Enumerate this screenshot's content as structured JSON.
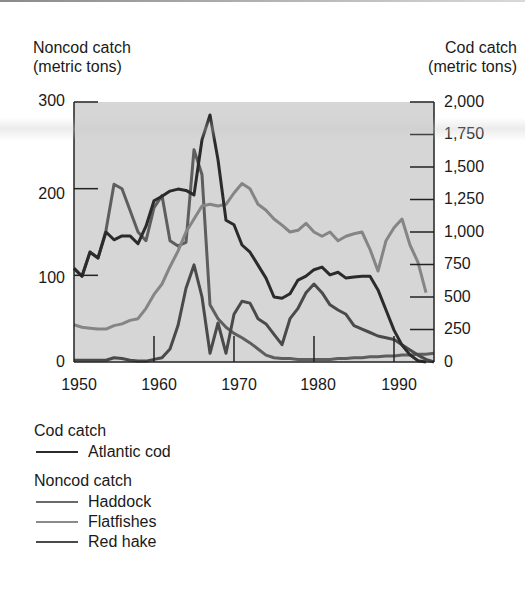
{
  "chart_data": {
    "type": "line",
    "title": "",
    "left_axis": {
      "title_line1": "Noncod catch",
      "title_line2": "(metric tons)",
      "ticks": [
        0,
        100,
        200,
        300
      ],
      "tick_labels": [
        "0",
        "100",
        "200",
        "300"
      ],
      "ylim": [
        0,
        300
      ]
    },
    "right_axis": {
      "title_line1": "Cod catch",
      "title_line2": "(metric tons)",
      "ticks": [
        0,
        250,
        500,
        750,
        1000,
        1250,
        1500,
        1750,
        2000
      ],
      "tick_labels": [
        "0",
        "250",
        "500",
        "750",
        "1,000",
        "1,250",
        "1,500",
        "1,750",
        "2,000"
      ],
      "ylim": [
        0,
        2000
      ]
    },
    "x_axis": {
      "xlabel": "",
      "ticks": [
        1950,
        1960,
        1970,
        1980,
        1990
      ],
      "tick_labels": [
        "1950",
        "1960",
        "1970",
        "1980",
        "1990"
      ],
      "xlim": [
        1950,
        1995
      ]
    },
    "grid": false,
    "background": "#d6d6d6",
    "series": [
      {
        "name": "Atlantic cod",
        "group": "Cod catch",
        "axis": "right",
        "color": "#2b2b2b",
        "width": 3,
        "x": [
          1950,
          1951,
          1952,
          1953,
          1954,
          1955,
          1956,
          1957,
          1958,
          1959,
          1960,
          1961,
          1962,
          1963,
          1964,
          1965,
          1966,
          1967,
          1968,
          1969,
          1970,
          1971,
          1972,
          1973,
          1974,
          1975,
          1976,
          1977,
          1978,
          1979,
          1980,
          1981,
          1982,
          1983,
          1984,
          1985,
          1986,
          1987,
          1988,
          1989,
          1990,
          1991,
          1992,
          1993,
          1994
        ],
        "values": [
          720,
          660,
          845,
          800,
          1000,
          940,
          970,
          970,
          910,
          1045,
          1240,
          1275,
          1315,
          1330,
          1320,
          1285,
          1710,
          1900,
          1555,
          1090,
          1055,
          900,
          845,
          745,
          645,
          500,
          490,
          525,
          630,
          660,
          710,
          730,
          670,
          690,
          645,
          655,
          660,
          660,
          555,
          400,
          245,
          130,
          55,
          10,
          0
        ]
      },
      {
        "name": "Haddock",
        "group": "Noncod catch",
        "axis": "left",
        "color": "#5e5e5e",
        "width": 3,
        "x": [
          1950,
          1951,
          1952,
          1953,
          1954,
          1955,
          1956,
          1957,
          1958,
          1959,
          1960,
          1961,
          1962,
          1963,
          1964,
          1965,
          1966,
          1967,
          1968,
          1969,
          1970,
          1971,
          1972,
          1973,
          1974,
          1975,
          1976,
          1977,
          1978,
          1979,
          1980,
          1981,
          1982,
          1983,
          1984,
          1985,
          1986,
          1987,
          1988,
          1989,
          1990,
          1991,
          1992,
          1993,
          1994,
          1995
        ],
        "values": [
          108,
          99,
          127,
          120,
          152,
          205,
          200,
          175,
          150,
          140,
          178,
          192,
          140,
          134,
          138,
          245,
          216,
          66,
          50,
          40,
          33,
          28,
          22,
          15,
          8,
          5,
          4,
          4,
          3,
          3,
          3,
          3,
          3,
          4,
          4,
          5,
          5,
          6,
          6,
          7,
          7,
          8,
          8,
          9,
          9,
          10
        ]
      },
      {
        "name": "Flatfishes",
        "group": "Noncod catch",
        "axis": "left",
        "color": "#858585",
        "width": 3,
        "x": [
          1950,
          1951,
          1952,
          1953,
          1954,
          1955,
          1956,
          1957,
          1958,
          1959,
          1960,
          1961,
          1962,
          1963,
          1964,
          1965,
          1966,
          1967,
          1968,
          1969,
          1970,
          1971,
          1972,
          1973,
          1974,
          1975,
          1976,
          1977,
          1978,
          1979,
          1980,
          1981,
          1982,
          1983,
          1984,
          1985,
          1986,
          1987,
          1988,
          1989,
          1990,
          1991,
          1992,
          1993,
          1994
        ],
        "values": [
          43,
          40,
          39,
          38,
          38,
          42,
          44,
          48,
          50,
          62,
          78,
          90,
          110,
          128,
          150,
          165,
          180,
          182,
          180,
          182,
          195,
          206,
          200,
          182,
          175,
          165,
          158,
          150,
          152,
          160,
          150,
          145,
          150,
          140,
          145,
          148,
          150,
          130,
          105,
          140,
          155,
          165,
          135,
          115,
          80
        ]
      },
      {
        "name": "Red hake",
        "group": "Noncod catch",
        "axis": "left",
        "color": "#4a4a4a",
        "width": 3,
        "x": [
          1950,
          1951,
          1952,
          1953,
          1954,
          1955,
          1956,
          1957,
          1958,
          1959,
          1960,
          1961,
          1962,
          1963,
          1964,
          1965,
          1966,
          1967,
          1968,
          1969,
          1970,
          1971,
          1972,
          1973,
          1974,
          1975,
          1976,
          1977,
          1978,
          1979,
          1980,
          1981,
          1982,
          1983,
          1984,
          1985,
          1986,
          1987,
          1988,
          1989,
          1990,
          1991,
          1992,
          1993,
          1994,
          1995
        ],
        "values": [
          2,
          2,
          2,
          2,
          2,
          5,
          4,
          2,
          1,
          1,
          3,
          5,
          15,
          42,
          85,
          112,
          75,
          10,
          45,
          10,
          55,
          70,
          68,
          50,
          44,
          32,
          20,
          50,
          62,
          80,
          90,
          80,
          66,
          60,
          55,
          42,
          38,
          34,
          30,
          28,
          26,
          20,
          14,
          8,
          3,
          0
        ]
      }
    ],
    "legend": {
      "position": "bottom-left",
      "groups": [
        {
          "title": "Cod catch",
          "entries": [
            "Atlantic cod"
          ]
        },
        {
          "title": "Noncod catch",
          "entries": [
            "Haddock",
            "Flatfishes",
            "Red hake"
          ]
        }
      ]
    }
  },
  "labels": {
    "left_title_1": "Noncod catch",
    "left_title_2": "(metric tons)",
    "right_title_1": "Cod catch",
    "right_title_2": "(metric tons)",
    "left_ticks": [
      "300",
      "200",
      "100",
      "0"
    ],
    "right_ticks": [
      "2,000",
      "1,750",
      "1,500",
      "1,250",
      "1,000",
      "750",
      "500",
      "250",
      "0"
    ],
    "x_ticks": [
      "1950",
      "1960",
      "1970",
      "1980",
      "1990"
    ],
    "legend_cod_title": "Cod catch",
    "legend_cod_1": "Atlantic cod",
    "legend_noncod_title": "Noncod catch",
    "legend_noncod_1": "Haddock",
    "legend_noncod_2": "Flatfishes",
    "legend_noncod_3": "Red hake"
  }
}
